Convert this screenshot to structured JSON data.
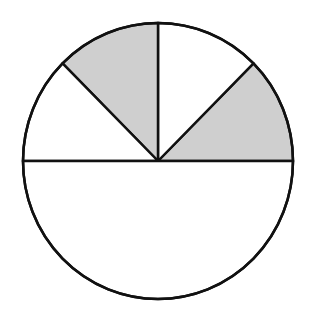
{
  "diagram": {
    "type": "partitioned-circle",
    "center": [
      158,
      161
    ],
    "radius_x": 135,
    "radius_y": 138,
    "stroke_color": "#111111",
    "shaded_color": "#cfcfcf",
    "unshaded_color": "#ffffff",
    "sectors": [
      {
        "name": "right-upper-sector",
        "from_deg": 0,
        "to_deg": 45,
        "shaded": true
      },
      {
        "name": "top-right-sector",
        "from_deg": 45,
        "to_deg": 90,
        "shaded": false
      },
      {
        "name": "top-left-sector",
        "from_deg": 90,
        "to_deg": 135,
        "shaded": true
      },
      {
        "name": "left-upper-sector",
        "from_deg": 135,
        "to_deg": 180,
        "shaded": false
      },
      {
        "name": "bottom-half-sector",
        "from_deg": 180,
        "to_deg": 360,
        "shaded": false
      }
    ]
  }
}
